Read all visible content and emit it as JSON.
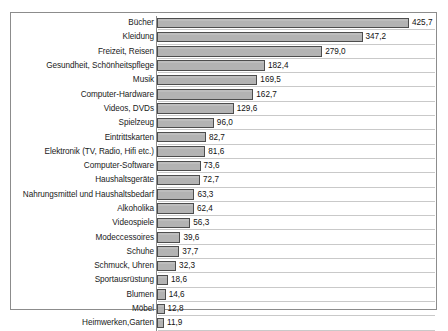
{
  "chart_data": {
    "type": "bar",
    "orientation": "horizontal",
    "title": "",
    "subtitle": "",
    "xlabel": "",
    "ylabel": "",
    "grid": true,
    "legend": "none",
    "xlim": [
      0,
      425.7
    ],
    "decimal_separator": ",",
    "categories": [
      "Bücher",
      "Kleidung",
      "Freizeit, Reisen",
      "Gesundheit, Schönheitspflege",
      "Musik",
      "Computer-Hardware",
      "Videos, DVDs",
      "Spielzeug",
      "Eintrittskarten",
      "Elektronik (TV, Radio, Hifi etc.)",
      "Computer-Software",
      "Haushaltsgeräte",
      "Nahrungsmittel und Haushaltsbedarf",
      "Alkoholika",
      "Videospiele",
      "Modeccessoires",
      "Schuhe",
      "Schmuck, Uhren",
      "Sportausrüstung",
      "Blumen",
      "Möbel",
      "Heimwerken,Garten"
    ],
    "values": [
      425.7,
      347.2,
      279.0,
      182.4,
      169.5,
      162.7,
      129.6,
      96.0,
      82.7,
      81.6,
      73.6,
      72.7,
      63.3,
      62.4,
      56.3,
      39.6,
      37.7,
      32.3,
      18.6,
      14.6,
      12.8,
      11.9
    ],
    "value_labels": [
      "425,7",
      "347,2",
      "279,0",
      "182,4",
      "169,5",
      "162,7",
      "129,6",
      "96,0",
      "82,7",
      "81,6",
      "73,6",
      "72,7",
      "63,3",
      "62,4",
      "56,3",
      "39,6",
      "37,7",
      "32,3",
      "18,6",
      "14,6",
      "12,8",
      "11,9"
    ],
    "colors": {
      "bar_fill": "#b3b3b3",
      "bar_border": "#4d4d4d",
      "gridline": "#c9c9c9",
      "frame": "#8c8c8c",
      "text": "#1a1a1a",
      "background": "#ffffff"
    }
  }
}
